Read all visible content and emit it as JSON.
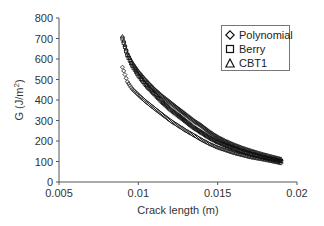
{
  "chart_data": {
    "type": "scatter",
    "title": "",
    "xlabel": "Crack length (m)",
    "ylabel": "G (J/m²)",
    "ylabel_base": "G (J/m",
    "ylabel_sup": "2",
    "ylabel_tail": ")",
    "xlim": [
      0.005,
      0.02
    ],
    "ylim": [
      0,
      800
    ],
    "x_ticks": [
      "0.005",
      "0.01",
      "0.015",
      "0.02"
    ],
    "y_ticks": [
      "0",
      "100",
      "200",
      "300",
      "400",
      "500",
      "600",
      "700",
      "800"
    ],
    "grid": false,
    "legend_position": "top-right",
    "series": [
      {
        "name": "Polynomial",
        "marker": "diamond",
        "x": [
          0.009,
          0.0093,
          0.0096,
          0.01,
          0.0105,
          0.011,
          0.0115,
          0.012,
          0.0125,
          0.013,
          0.0135,
          0.014,
          0.0145,
          0.015,
          0.0155,
          0.016,
          0.0165,
          0.017,
          0.0175,
          0.018,
          0.0185,
          0.019
        ],
        "y": [
          560,
          490,
          455,
          425,
          390,
          360,
          330,
          300,
          275,
          250,
          228,
          205,
          185,
          168,
          155,
          142,
          132,
          122,
          115,
          108,
          100,
          92
        ]
      },
      {
        "name": "Berry",
        "marker": "square",
        "x": [
          0.009,
          0.0093,
          0.0096,
          0.01,
          0.0105,
          0.011,
          0.0115,
          0.012,
          0.0125,
          0.013,
          0.0135,
          0.014,
          0.0145,
          0.015,
          0.0155,
          0.016,
          0.0165,
          0.017,
          0.0175,
          0.018,
          0.0185,
          0.019
        ],
        "y": [
          700,
          620,
          570,
          520,
          470,
          430,
          390,
          355,
          325,
          295,
          265,
          240,
          215,
          195,
          178,
          163,
          150,
          138,
          128,
          118,
          110,
          102
        ]
      },
      {
        "name": "CBT1",
        "marker": "triangle",
        "x": [
          0.009,
          0.0093,
          0.0096,
          0.01,
          0.0105,
          0.011,
          0.0115,
          0.012,
          0.0125,
          0.013,
          0.0135,
          0.014,
          0.0145,
          0.015,
          0.0155,
          0.016,
          0.0165,
          0.017,
          0.0175,
          0.018,
          0.0185,
          0.019
        ],
        "y": [
          710,
          630,
          585,
          540,
          495,
          455,
          420,
          390,
          360,
          330,
          300,
          275,
          245,
          220,
          200,
          183,
          168,
          155,
          143,
          132,
          122,
          112
        ]
      }
    ]
  }
}
